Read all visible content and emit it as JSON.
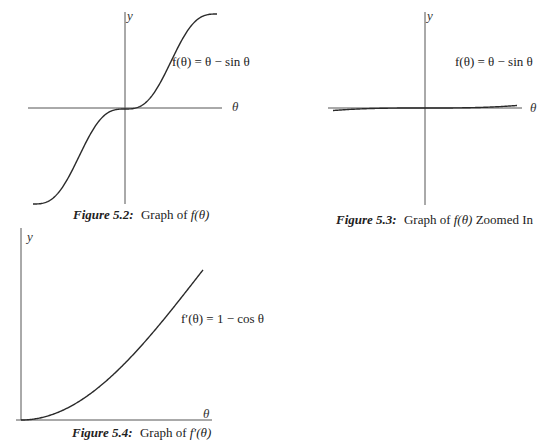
{
  "figures": [
    {
      "id": "fig-5-2",
      "caption_prefix": "Figure 5.2:",
      "caption_text": "Graph of ",
      "caption_math": "f(θ)",
      "caption_suffix": "",
      "y_label": "y",
      "x_label": "θ",
      "equation": "f(θ) = θ − sin θ"
    },
    {
      "id": "fig-5-3",
      "caption_prefix": "Figure 5.3:",
      "caption_text": "Graph of ",
      "caption_math": "f(θ)",
      "caption_suffix": " Zoomed In",
      "y_label": "y",
      "x_label": "θ",
      "equation": "f(θ) = θ − sin θ"
    },
    {
      "id": "fig-5-4",
      "caption_prefix": "Figure 5.4:",
      "caption_text": "Graph of ",
      "caption_math": "f′(θ)",
      "caption_suffix": "",
      "y_label": "y",
      "x_label": "θ",
      "equation": "f′(θ) = 1 − cos θ"
    }
  ],
  "chart_data": [
    {
      "type": "line",
      "title": "Figure 5.2: Graph of f(θ)",
      "xlabel": "θ",
      "ylabel": "y",
      "series": [
        {
          "name": "f(θ) = θ − sin θ",
          "function": "θ - sin(θ)"
        }
      ],
      "xlim": [
        -6.283,
        6.283
      ],
      "ylim": [
        -6.283,
        6.283
      ],
      "grid": false,
      "ticks": "none"
    },
    {
      "type": "line",
      "title": "Figure 5.3: Graph of f(θ) Zoomed In",
      "xlabel": "θ",
      "ylabel": "y",
      "series": [
        {
          "name": "f(θ) = θ − sin θ",
          "function": "θ - sin(θ)"
        }
      ],
      "xlim": [
        -1,
        1
      ],
      "ylim": [
        -1,
        1
      ],
      "grid": false,
      "ticks": "none"
    },
    {
      "type": "line",
      "title": "Figure 5.4: Graph of f′(θ)",
      "xlabel": "θ",
      "ylabel": "y",
      "series": [
        {
          "name": "f′(θ) = 1 − cos θ",
          "function": "1 - cos(θ)"
        }
      ],
      "xlim": [
        0,
        1.6
      ],
      "ylim": [
        0,
        1.2
      ],
      "grid": false,
      "ticks": "none"
    }
  ]
}
